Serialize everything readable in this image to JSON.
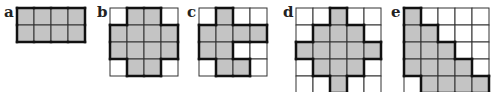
{
  "colors": {
    "fill": "#c4c4c4",
    "empty": "#ffffff",
    "thin_line": "#333333",
    "thick_line": "#111111"
  },
  "panels": [
    {
      "label": "a",
      "x": 17,
      "y": 8,
      "cell": 17,
      "cols": 4,
      "rows": 2,
      "shaded": [
        [
          1,
          1,
          1,
          1
        ],
        [
          1,
          1,
          1,
          1
        ]
      ]
    },
    {
      "label": "b",
      "x": 110,
      "y": 8,
      "cell": 17,
      "cols": 4,
      "rows": 4,
      "shaded": [
        [
          0,
          1,
          1,
          0
        ],
        [
          1,
          1,
          1,
          1
        ],
        [
          1,
          1,
          1,
          1
        ],
        [
          0,
          1,
          1,
          0
        ]
      ]
    },
    {
      "label": "c",
      "x": 199,
      "y": 8,
      "cell": 17,
      "cols": 4,
      "rows": 4,
      "shaded": [
        [
          0,
          1,
          0,
          0
        ],
        [
          1,
          1,
          1,
          1
        ],
        [
          1,
          1,
          0,
          0
        ],
        [
          0,
          1,
          1,
          0
        ]
      ]
    },
    {
      "label": "d",
      "x": 296,
      "y": 8,
      "cell": 17,
      "cols": 5,
      "rows": 5,
      "shaded": [
        [
          0,
          0,
          1,
          0,
          0
        ],
        [
          0,
          1,
          1,
          1,
          0
        ],
        [
          1,
          1,
          1,
          1,
          1
        ],
        [
          0,
          1,
          1,
          1,
          0
        ],
        [
          0,
          0,
          1,
          0,
          0
        ]
      ]
    },
    {
      "label": "e",
      "x": 404,
      "y": 8,
      "cell": 17,
      "cols": 5,
      "rows": 5,
      "shaded": [
        [
          1,
          0,
          0,
          0,
          0
        ],
        [
          1,
          1,
          0,
          0,
          0
        ],
        [
          1,
          1,
          1,
          0,
          0
        ],
        [
          1,
          1,
          1,
          1,
          0
        ],
        [
          0,
          1,
          1,
          1,
          1
        ]
      ]
    }
  ]
}
